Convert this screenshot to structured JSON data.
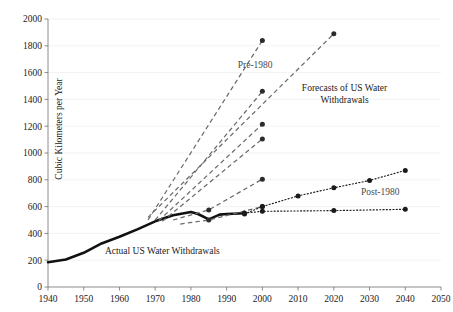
{
  "chart_data": {
    "type": "line",
    "title": "",
    "xlabel": "",
    "ylabel": "Cubic Kilometers per Year",
    "xlim": [
      1940,
      2050
    ],
    "ylim": [
      0,
      2000
    ],
    "grid": true,
    "legend_position": "inline-annotations",
    "x_ticks": [
      1940,
      1950,
      1960,
      1970,
      1980,
      1990,
      2000,
      2010,
      2020,
      2030,
      2040,
      2050
    ],
    "y_ticks": [
      0,
      200,
      400,
      600,
      800,
      1000,
      1200,
      1400,
      1600,
      1800,
      2000
    ],
    "annotations": [
      {
        "text": "Forecasts of US Water Withdrawals",
        "x": 2023,
        "y": 1460
      },
      {
        "text": "Pre-1980",
        "x": 1998,
        "y": 1635
      },
      {
        "text": "Post-1980",
        "x": 2033,
        "y": 690
      },
      {
        "text": "Actual US Water Withdrawals",
        "x": 1972,
        "y": 245
      }
    ],
    "series": [
      {
        "name": "Actual US Water Withdrawals",
        "style": "solid",
        "color": "#111111",
        "markers": false,
        "x": [
          1940,
          1945,
          1950,
          1955,
          1960,
          1965,
          1970,
          1975,
          1980,
          1982,
          1985,
          1988,
          1990,
          1995
        ],
        "values": [
          185,
          205,
          255,
          325,
          375,
          430,
          490,
          535,
          560,
          545,
          505,
          540,
          545,
          550
        ]
      },
      {
        "name": "Pre-1980 forecast 1",
        "style": "dashed",
        "color": "#6b6b6b",
        "markers": true,
        "x": [
          1968,
          2000
        ],
        "values": [
          500,
          1840
        ]
      },
      {
        "name": "Pre-1980 forecast 2",
        "style": "dashed",
        "color": "#6b6b6b",
        "markers": true,
        "x": [
          1968,
          2020
        ],
        "values": [
          520,
          1890
        ]
      },
      {
        "name": "Pre-1980 forecast 3",
        "style": "dashed",
        "color": "#6b6b6b",
        "markers": true,
        "x": [
          1970,
          2000
        ],
        "values": [
          500,
          1460
        ]
      },
      {
        "name": "Pre-1980 forecast 4",
        "style": "dashed",
        "color": "#6b6b6b",
        "markers": true,
        "x": [
          1971,
          2000
        ],
        "values": [
          495,
          1215
        ]
      },
      {
        "name": "Pre-1980 forecast 5",
        "style": "dashed",
        "color": "#6b6b6b",
        "markers": true,
        "x": [
          1972,
          2000
        ],
        "values": [
          490,
          1105
        ]
      },
      {
        "name": "Pre-1980 forecast 6",
        "style": "dashed",
        "color": "#6b6b6b",
        "markers": true,
        "x": [
          1975,
          1985,
          2000
        ],
        "values": [
          500,
          575,
          805
        ]
      },
      {
        "name": "Pre-1980 forecast 7",
        "style": "dashed",
        "color": "#6b6b6b",
        "markers": true,
        "x": [
          1977,
          1985,
          2000
        ],
        "values": [
          470,
          500,
          600
        ]
      },
      {
        "name": "Post-1980 forecast high",
        "style": "dotted",
        "color": "#1b1b1b",
        "markers": true,
        "x": [
          1995,
          2000,
          2010,
          2020,
          2030,
          2040
        ],
        "values": [
          545,
          600,
          680,
          740,
          795,
          870
        ]
      },
      {
        "name": "Post-1980 forecast low",
        "style": "dotted",
        "color": "#1b1b1b",
        "markers": true,
        "x": [
          1995,
          2000,
          2020,
          2040
        ],
        "values": [
          552,
          565,
          570,
          580
        ]
      }
    ]
  }
}
